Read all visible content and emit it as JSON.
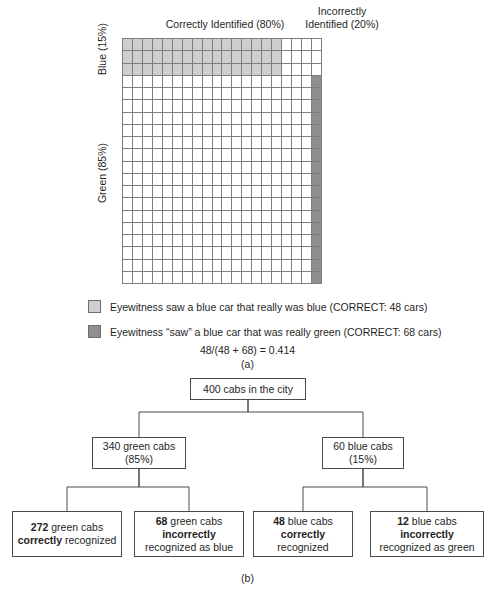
{
  "panel_a": {
    "column_headers": {
      "correct": "Correctly Identified (80%)",
      "incorrect": "Incorrectly\nIdentified (20%)"
    },
    "row_labels": {
      "blue": "Blue (15%)",
      "green": "Green (85%)"
    },
    "legend": [
      {
        "swatch": "light-grey-swatch",
        "color": "#cfcfcf",
        "text": "Eyewitness saw a blue car that really was blue (CORRECT: 48 cars)"
      },
      {
        "swatch": "dark-grey-swatch",
        "color": "#8f8f8f",
        "text": "Eyewitness “saw” a blue car that was really green (CORRECT: 68 cars)"
      }
    ],
    "formula": "48/(48 + 68) = 0.414",
    "figure_label": "(a)"
  },
  "chart_data": {
    "type": "heatmap",
    "rows": 20,
    "cols": 20,
    "total_cells": 400,
    "xlabel": "Identification accuracy",
    "ylabel": "Actual cab color",
    "x_groups": [
      {
        "label": "Correctly Identified (80%)",
        "cols": 16,
        "percent": 80
      },
      {
        "label": "Incorrectly Identified (20%)",
        "cols": 4,
        "percent": 20
      }
    ],
    "y_groups": [
      {
        "label": "Blue (15%)",
        "rows": 3,
        "percent": 15
      },
      {
        "label": "Green (85%)",
        "rows": 17,
        "percent": 85
      }
    ],
    "regions": [
      {
        "name": "blue-correct",
        "color": "#cfcfcf",
        "row_start": 0,
        "row_end": 2,
        "col_start": 0,
        "col_end": 15,
        "cars": 48
      },
      {
        "name": "blue-incorrect",
        "color": "#ffffff",
        "row_start": 0,
        "row_end": 2,
        "col_start": 16,
        "col_end": 19,
        "cars": 12
      },
      {
        "name": "green-correct",
        "color": "#ffffff",
        "row_start": 3,
        "row_end": 19,
        "col_start": 0,
        "col_end": 18,
        "cars": 272
      },
      {
        "name": "green-incorrect",
        "color": "#8f8f8f",
        "row_start": 3,
        "row_end": 19,
        "col_start": 19,
        "col_end": 19,
        "cars": 68
      }
    ],
    "grid": true,
    "legend_position": "below"
  },
  "panel_b": {
    "figure_label": "(b)",
    "nodes": {
      "root": {
        "lines": [
          "400 cabs in the city"
        ]
      },
      "green": {
        "lines": [
          "340 green cabs",
          "(85%)"
        ]
      },
      "blue": {
        "lines": [
          "60 blue cabs",
          "(15%)"
        ]
      },
      "leaf1_l1": "272",
      "leaf1_l1b": " green cabs",
      "leaf1_l2": "correctly",
      "leaf1_l2b": " recognized",
      "leaf2_l1": "68",
      "leaf2_l1b": " green cabs",
      "leaf2_l2": "incorrectly",
      "leaf2_l3": "recognized as blue",
      "leaf3_l1": "48",
      "leaf3_l1b": "  blue cabs",
      "leaf3_l2": "correctly",
      "leaf3_l3": "recognized",
      "leaf4_l1": "12",
      "leaf4_l1b": " blue cabs",
      "leaf4_l2": "incorrectly",
      "leaf4_l3": "recognized as green"
    }
  }
}
